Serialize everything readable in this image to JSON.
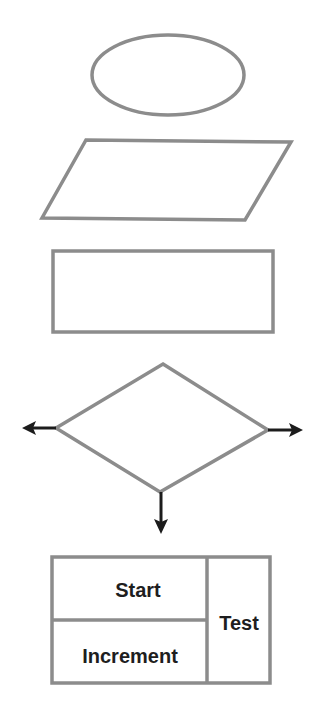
{
  "diagram": {
    "type": "flowchart-symbols",
    "colors": {
      "outline": "#8c8c8c",
      "arrow": "#1c1c1c",
      "text": "#1e1e1e",
      "background": "#ffffff"
    },
    "shapes": [
      {
        "id": "terminal",
        "kind": "ellipse",
        "label": ""
      },
      {
        "id": "input-output",
        "kind": "parallelogram",
        "label": ""
      },
      {
        "id": "process",
        "kind": "rectangle",
        "label": ""
      },
      {
        "id": "decision",
        "kind": "diamond",
        "label": "",
        "exits": [
          "left",
          "right",
          "bottom"
        ]
      },
      {
        "id": "loop",
        "kind": "loop-box",
        "label": ""
      }
    ],
    "loop_box": {
      "start_label": "Start",
      "increment_label": "Increment",
      "test_label": "Test"
    }
  }
}
